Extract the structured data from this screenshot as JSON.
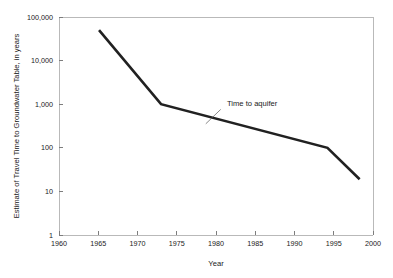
{
  "chart_data": {
    "type": "line",
    "title": "",
    "xlabel": "Year",
    "ylabel": "Estimate of Travel Time to Groundwater Table, in years",
    "xlim": [
      1960,
      2000
    ],
    "ylim": [
      1,
      100000
    ],
    "yscale": "log",
    "xscale": "linear",
    "grid": false,
    "legend": false,
    "x_ticks": [
      1960,
      1965,
      1970,
      1975,
      1980,
      1985,
      1990,
      1995,
      2000
    ],
    "x_tick_labels": [
      "1960",
      "1965",
      "1970",
      "1975",
      "1980",
      "1985",
      "1990",
      "1995",
      "2000"
    ],
    "y_ticks": [
      1,
      10,
      100,
      1000,
      10000,
      100000
    ],
    "y_tick_labels": [
      "1",
      "10",
      "100",
      "1,000",
      "10,000",
      "100,000"
    ],
    "series": [
      {
        "name": "Time to aquifer",
        "color": "#212121",
        "x": [
          1965.1,
          1973.0,
          1994.2,
          1998.3
        ],
        "values": [
          50000,
          1000,
          100,
          19
        ]
      }
    ],
    "annotations": [
      {
        "text": "Time to aquifer",
        "x": 1981.4,
        "y": 900,
        "leader_from_x": 1980.6,
        "leader_from_y": 760,
        "leader_to_x": 1978.7,
        "leader_to_y": 355
      }
    ]
  },
  "axes": {
    "x_axis_title": "Year",
    "y_axis_title": "Estimate of Travel Time to Groundwater Table, in years"
  },
  "colors": {
    "series": "#212121",
    "frame": "#b9b9b9",
    "tick": "#7d7d7d",
    "text": "#1a1a1a",
    "background": "#ffffff"
  }
}
